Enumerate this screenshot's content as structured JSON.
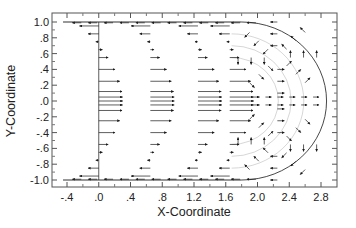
{
  "chart_data": {
    "type": "quiver",
    "title": "",
    "xlabel": "X-Coordinate",
    "ylabel": "Y-Coordinate",
    "xlim": [
      -0.5,
      3.0
    ],
    "ylim": [
      -1.05,
      1.05
    ],
    "xticks": [
      -0.4,
      0.0,
      0.4,
      0.8,
      1.2,
      1.6,
      2.0,
      2.4,
      2.8
    ],
    "xtick_labels": [
      "-.4",
      ".0",
      ".4",
      ".8",
      "1.2",
      "1.6",
      "2.0",
      "2.4",
      "2.8"
    ],
    "yticks": [
      1.0,
      0.8,
      0.6,
      0.4,
      0.2,
      0.0,
      -0.2,
      -0.4,
      -0.6,
      -0.8,
      -1.0
    ],
    "ytick_labels": [
      "1.0",
      ".8",
      ".6",
      ".4",
      ".2",
      ".0",
      "-.2",
      "-.4",
      "-.6",
      "-.8",
      "-1.0"
    ],
    "grid": false,
    "legend": null,
    "annotations": [
      "Vertical boundary line at x = 0.0 from y = -1.0 to 1.0",
      "Curved boundary (semicircle) from (1.8, 1.0) through (2.85, 0.0) to (1.8, -1.0)",
      "Parabolic front profiles of arrows near x = 0.0, 0.6, 1.2, 1.6",
      "Recirculation vortices between x = 1.8 and x = 2.8"
    ],
    "colors": {
      "arrow": "#1a1a1a",
      "frame": "#555555",
      "boundary": "#333333"
    }
  }
}
